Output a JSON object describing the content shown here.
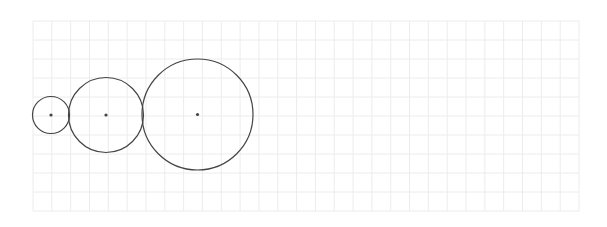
{
  "diagram": {
    "background": "#ffffff",
    "grid": {
      "x": 33,
      "y": 21,
      "width": 546,
      "height": 190,
      "columns": 29,
      "rows": 10,
      "color": "#ececec"
    },
    "stroke_color": "#444444",
    "center_dot_color": "#444444",
    "circles": [
      {
        "id": "small",
        "cx": 51,
        "cy": 115,
        "r": 18.5
      },
      {
        "id": "medium",
        "cx": 106,
        "cy": 115,
        "r": 37.5
      },
      {
        "id": "large",
        "cx": 197.5,
        "cy": 114.5,
        "r": 55.5
      }
    ]
  }
}
